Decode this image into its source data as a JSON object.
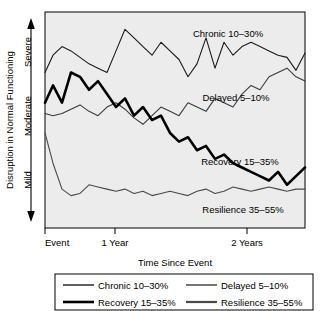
{
  "chart_data": {
    "type": "line",
    "title": "",
    "xlabel": "Time Since Event",
    "ylabel": "Disruption in Normal Functioning",
    "xticklabels": [
      "Event",
      "1 Year",
      "2 Years"
    ],
    "xtickvalues": [
      0,
      12,
      24
    ],
    "yticklabels": [
      "Severe",
      "Moderate",
      "Mild"
    ],
    "ytickvalues": [
      85,
      55,
      25
    ],
    "xlim": [
      0,
      26
    ],
    "ylim": [
      0,
      100
    ],
    "grid": false,
    "y_axis_direction_arrow": "double",
    "legend_position": "below-plot",
    "legend_columns": 2,
    "series": [
      {
        "name": "Chronic 10–30%",
        "color": "#1a1a1a",
        "linewidth": 1.1,
        "label_in_plot": "Chronic 10–30%",
        "x": [
          0,
          0.8,
          1.7,
          2.6,
          3.5,
          4.4,
          5.3,
          6.2,
          7.1,
          8.0,
          8.9,
          9.8,
          10.7,
          11.6,
          12.5,
          13.4,
          14.3,
          15.2,
          16.1,
          17.0,
          17.9,
          18.8,
          19.7,
          20.6,
          21.5,
          22.4,
          23.3,
          24.2,
          25.1,
          26.0
        ],
        "y": [
          72,
          80,
          84,
          82,
          79,
          76,
          74,
          72,
          82,
          92,
          88,
          84,
          80,
          86,
          82,
          78,
          70,
          76,
          88,
          74,
          86,
          80,
          84,
          86,
          84,
          82,
          80,
          79,
          73,
          81
        ]
      },
      {
        "name": "Delayed 5–10%",
        "color": "#3a3a3a",
        "linewidth": 1.1,
        "label_in_plot": "Delayed 5–10%",
        "x": [
          0,
          0.8,
          1.7,
          2.6,
          3.5,
          4.4,
          5.3,
          6.2,
          7.1,
          8.0,
          8.9,
          9.8,
          10.7,
          11.6,
          12.5,
          13.4,
          14.3,
          15.2,
          16.1,
          17.0,
          17.9,
          18.8,
          19.7,
          20.6,
          21.5,
          22.4,
          23.3,
          24.2,
          25.1,
          26.0
        ],
        "y": [
          53,
          52,
          53,
          55,
          57,
          54,
          52,
          56,
          58,
          55,
          51,
          48,
          52,
          56,
          54,
          52,
          58,
          56,
          54,
          60,
          58,
          56,
          62,
          66,
          64,
          70,
          72,
          74,
          70,
          68
        ]
      },
      {
        "name": "Recovery 15–35%",
        "color": "#000000",
        "linewidth": 2.6,
        "label_in_plot": "Recovery 15–35%",
        "x": [
          0,
          0.8,
          1.7,
          2.6,
          3.5,
          4.4,
          5.3,
          6.2,
          7.1,
          8.0,
          8.9,
          9.8,
          10.7,
          11.6,
          12.5,
          13.4,
          14.3,
          15.2,
          16.1,
          17.0,
          17.9,
          18.8,
          19.7,
          20.6,
          21.5,
          22.4,
          23.3,
          24.2,
          25.1,
          26.0
        ],
        "y": [
          58,
          66,
          58,
          72,
          70,
          64,
          68,
          62,
          56,
          60,
          52,
          56,
          50,
          52,
          44,
          40,
          42,
          36,
          38,
          32,
          34,
          30,
          28,
          26,
          24,
          22,
          26,
          20,
          24,
          28
        ]
      },
      {
        "name": "Resilience 35–55%",
        "color": "#4a4a4a",
        "linewidth": 1.1,
        "label_in_plot": "Resilience 35–55%",
        "x": [
          0,
          0.8,
          1.7,
          2.6,
          3.5,
          4.4,
          5.3,
          6.2,
          7.1,
          8.0,
          8.9,
          9.8,
          10.7,
          11.6,
          12.5,
          13.4,
          14.3,
          15.2,
          16.1,
          17.0,
          17.9,
          18.8,
          19.7,
          20.6,
          21.5,
          22.4,
          23.3,
          24.2,
          25.1,
          26.0
        ],
        "y": [
          44,
          30,
          18,
          15,
          16,
          20,
          19,
          18,
          17,
          18,
          16,
          17,
          15,
          16,
          17,
          16,
          15,
          17,
          18,
          16,
          17,
          19,
          18,
          17,
          18,
          19,
          18,
          17,
          18,
          18
        ]
      }
    ]
  },
  "legend": {
    "entries": [
      {
        "label": "Chronic 10–30%",
        "color": "#1a1a1a",
        "linewidth": 1.4
      },
      {
        "label": "Delayed 5–10%",
        "color": "#3a3a3a",
        "linewidth": 1.4
      },
      {
        "label": "Recovery 15–35%",
        "color": "#000000",
        "linewidth": 2.6
      },
      {
        "label": "Resilience 35–55%",
        "color": "#4a4a4a",
        "linewidth": 2.2
      }
    ]
  },
  "colors": {
    "plot_background": "#ececec",
    "plot_border": "#000000",
    "page_background": "#ffffff",
    "text": "#000000"
  }
}
